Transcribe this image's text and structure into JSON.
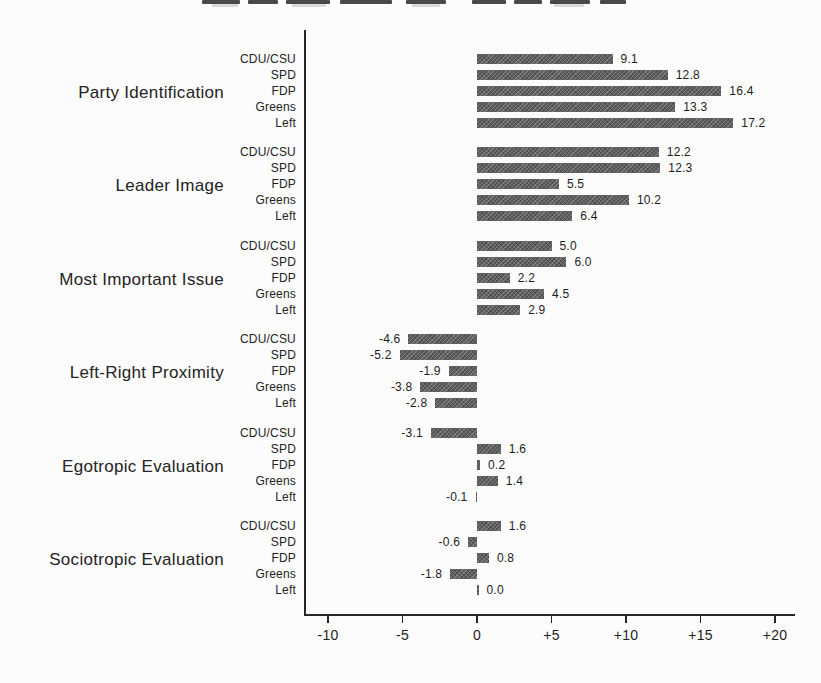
{
  "chart_data": {
    "type": "bar",
    "orientation": "horizontal",
    "title": "",
    "xlabel": "",
    "ylabel": "",
    "categories": [
      "CDU/CSU",
      "SPD",
      "FDP",
      "Greens",
      "Left"
    ],
    "groups": [
      {
        "label": "Party Identification",
        "values": [
          9.1,
          12.8,
          16.4,
          13.3,
          17.2
        ]
      },
      {
        "label": "Leader Image",
        "values": [
          12.2,
          12.3,
          5.5,
          10.2,
          6.4
        ]
      },
      {
        "label": "Most Important Issue",
        "values": [
          5.0,
          6.0,
          2.2,
          4.5,
          2.9
        ]
      },
      {
        "label": "Left-Right Proximity",
        "values": [
          -4.6,
          -5.2,
          -1.9,
          -3.8,
          -2.8
        ]
      },
      {
        "label": "Egotropic Evaluation",
        "values": [
          -3.1,
          1.6,
          0.2,
          1.4,
          -0.1
        ]
      },
      {
        "label": "Sociotropic Evaluation",
        "values": [
          1.6,
          -0.6,
          0.8,
          -1.8,
          0.0
        ]
      }
    ],
    "value_label_decimals": 1,
    "xticks": [
      {
        "value": -10,
        "label": "-10"
      },
      {
        "value": -5,
        "label": "-5"
      },
      {
        "value": 0,
        "label": "0"
      },
      {
        "value": 5,
        "label": "+5"
      },
      {
        "value": 10,
        "label": "+10"
      },
      {
        "value": 15,
        "label": "+15"
      },
      {
        "value": 20,
        "label": "+20"
      }
    ],
    "xlim": [
      -11.6,
      21.3
    ],
    "grid": false,
    "legend": null,
    "bar_color": "#5e5e5e",
    "axis_color": "#262626",
    "text_color": "#1c1c1c"
  }
}
